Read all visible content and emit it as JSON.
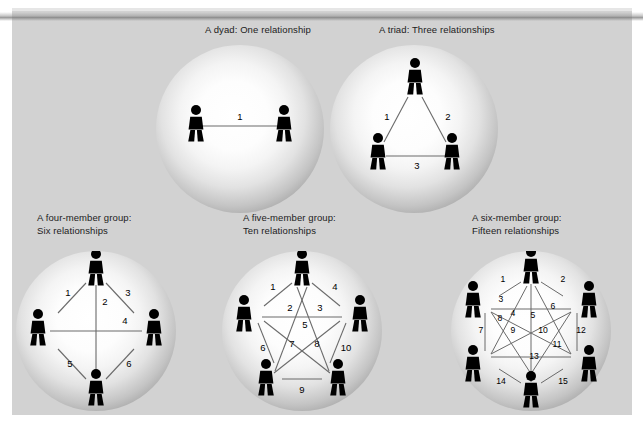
{
  "figure": {
    "background_color": "#d2d2d2",
    "page_color": "#ffffff",
    "sphere_edge_color": "#7d7d7d",
    "sphere_center_color": "#ffffff",
    "figure_color": "#000000",
    "line_color": "#6a6a6a"
  },
  "groups": [
    {
      "id": "dyad",
      "caption": "A dyad: One relationship",
      "members": 2,
      "relationships": 1,
      "labels": [
        "1"
      ]
    },
    {
      "id": "triad",
      "caption": "A triad: Three relationships",
      "members": 3,
      "relationships": 3,
      "labels": [
        "1",
        "2",
        "3"
      ]
    },
    {
      "id": "four-member",
      "caption": "A four-member group:\nSix relationships",
      "members": 4,
      "relationships": 6,
      "labels": [
        "1",
        "2",
        "3",
        "4",
        "5",
        "6"
      ]
    },
    {
      "id": "five-member",
      "caption": "A five-member group:\nTen relationships",
      "members": 5,
      "relationships": 10,
      "labels": [
        "1",
        "2",
        "3",
        "4",
        "5",
        "6",
        "7",
        "8",
        "9",
        "10"
      ]
    },
    {
      "id": "six-member",
      "caption": "A six-member group:\nFifteen relationships",
      "members": 6,
      "relationships": 15,
      "labels": [
        "1",
        "2",
        "3",
        "4",
        "5",
        "6",
        "7",
        "8",
        "9",
        "10",
        "11",
        "12",
        "13",
        "14",
        "15"
      ]
    }
  ]
}
